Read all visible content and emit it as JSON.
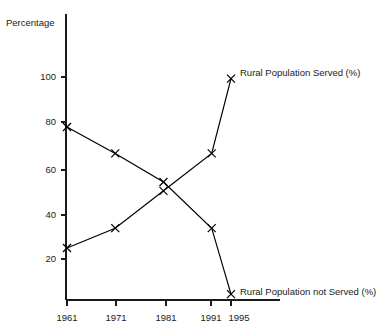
{
  "chart_data": {
    "type": "line",
    "title": "",
    "xlabel": "",
    "ylabel": "Percentage",
    "x": [
      1961,
      1971,
      1981,
      1991,
      1995
    ],
    "categories": [
      "1961",
      "1971",
      "1981",
      "1991",
      "1995"
    ],
    "xlim": [
      1958,
      1997
    ],
    "ylim": [
      0,
      110
    ],
    "yticks": [
      20,
      40,
      60,
      80,
      100
    ],
    "ytick_labels": [
      "20",
      "40",
      "60",
      "80",
      "100"
    ],
    "xticks": [
      1961,
      1971,
      1981,
      1991,
      1995
    ],
    "xtick_labels": [
      "1961",
      "1971",
      "1981",
      "1991",
      "1995"
    ],
    "grid": false,
    "legend_position": "inline-right-of-endpoint",
    "marker": "x",
    "series": [
      {
        "name": "Rural Population Served (%)",
        "label": "Rural Population Served (%)",
        "values": [
          25,
          34,
          51,
          68,
          102
        ],
        "points": [
          {
            "x": 1961,
            "y": 25
          },
          {
            "x": 1971,
            "y": 34
          },
          {
            "x": 1981,
            "y": 51
          },
          {
            "x": 1991,
            "y": 68
          },
          {
            "x": 1995,
            "y": 102
          }
        ]
      },
      {
        "name": "Rural Population not Served (%)",
        "label": "Rural Population not Served (%)",
        "values": [
          80,
          68,
          55,
          34,
          4
        ],
        "points": [
          {
            "x": 1961,
            "y": 80
          },
          {
            "x": 1971,
            "y": 68
          },
          {
            "x": 1981,
            "y": 55
          },
          {
            "x": 1991,
            "y": 34
          },
          {
            "x": 1995,
            "y": 4
          }
        ]
      }
    ]
  },
  "axes": {
    "y_axis_title": "Percentage",
    "y_tick_20": "20",
    "y_tick_40": "40",
    "y_tick_60": "60",
    "y_tick_80": "80",
    "y_tick_100": "100",
    "x_tick_1961": "1961",
    "x_tick_1971": "1971",
    "x_tick_1981": "1981",
    "x_tick_1991": "1991",
    "x_tick_1995": "1995"
  },
  "labels": {
    "served": "Rural Population Served (%)",
    "not_served": "Rural Population not Served (%)"
  },
  "colors": {
    "ink": "#1a1a1a",
    "line": "#000000",
    "background": "#ffffff"
  }
}
